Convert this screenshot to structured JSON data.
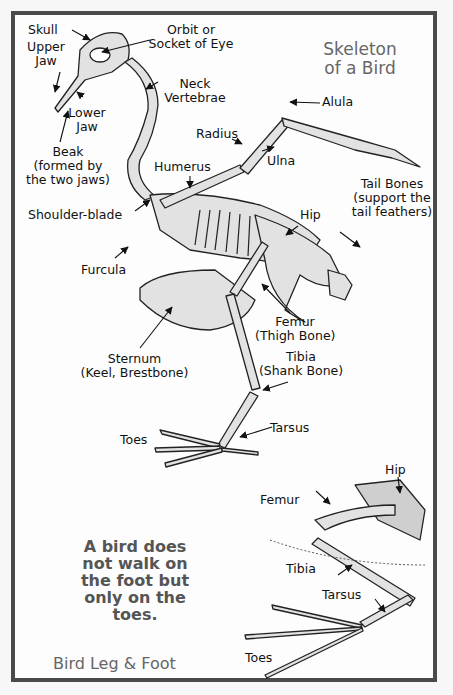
{
  "title": {
    "line1": "Skeleton",
    "line2": "of a Bird"
  },
  "labels": {
    "skull": "Skull",
    "upper_jaw_1": "Upper",
    "upper_jaw_2": "Jaw",
    "orbit_1": "Orbit or",
    "orbit_2": "Socket of Eye",
    "neck_1": "Neck",
    "neck_2": "Vertebrae",
    "lower_jaw_1": "Lower",
    "lower_jaw_2": "Jaw",
    "alula": "Alula",
    "radius": "Radius",
    "ulna": "Ulna",
    "beak_1": "Beak",
    "beak_2": "(formed by",
    "beak_3": "the two jaws)",
    "humerus": "Humerus",
    "tail_1": "Tail Bones",
    "tail_2": "(support the",
    "tail_3": "tail feathers)",
    "shoulder": "Shoulder-blade",
    "hip": "Hip",
    "furcula": "Furcula",
    "femur_1": "Femur",
    "femur_2": "(Thigh Bone)",
    "sternum_1": "Sternum",
    "sternum_2": "(Keel, Brestbone)",
    "tibia_1": "Tibia",
    "tibia_2": "(Shank Bone)",
    "toes": "Toes",
    "tarsus": "Tarsus"
  },
  "inset": {
    "hip": "Hip",
    "femur": "Femur",
    "tibia": "Tibia",
    "tarsus": "Tarsus",
    "toes": "Toes",
    "note_1": "A bird does",
    "note_2": "not walk on",
    "note_3": "the foot but",
    "note_4": "only on the",
    "note_5": "toes.",
    "caption": "Bird Leg & Foot"
  },
  "colors": {
    "border": "#4a4a4a",
    "bone_fill": "#e2e2e2",
    "bone_stroke": "#222222",
    "title": "#666666"
  }
}
